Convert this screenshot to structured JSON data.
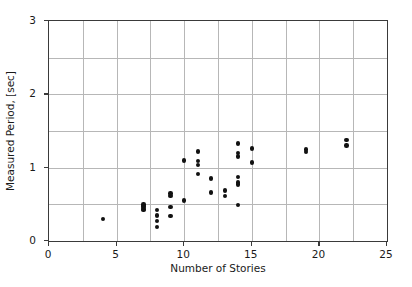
{
  "chart_data": {
    "type": "scatter",
    "title": "",
    "xlabel": "Number of Stories",
    "ylabel": "Measured Period, [sec]",
    "xlim": [
      0,
      25
    ],
    "ylim": [
      0,
      3
    ],
    "xticks": [
      0,
      5,
      10,
      15,
      20,
      25
    ],
    "yticks": [
      0,
      1,
      2,
      3
    ],
    "xticklabels": [
      "0",
      "5",
      "10",
      "15",
      "20",
      "25"
    ],
    "yticklabels": [
      "0",
      "1",
      "2",
      "3"
    ],
    "x_minor_gridlines": [
      2.5,
      5,
      7.5,
      10,
      12.5,
      15,
      17.5,
      20,
      22.5
    ],
    "y_minor_gridlines": [
      0.5,
      1.0,
      1.5,
      2.0,
      2.5
    ],
    "grid": true,
    "legend": null,
    "marker": "circle",
    "marker_color": "#111111",
    "points": [
      {
        "x": 4,
        "y": 0.3
      },
      {
        "x": 7,
        "y": 0.5
      },
      {
        "x": 7,
        "y": 0.48
      },
      {
        "x": 7,
        "y": 0.46
      },
      {
        "x": 7,
        "y": 0.44
      },
      {
        "x": 7,
        "y": 0.42
      },
      {
        "x": 8,
        "y": 0.42
      },
      {
        "x": 8,
        "y": 0.35
      },
      {
        "x": 8,
        "y": 0.27
      },
      {
        "x": 8,
        "y": 0.19
      },
      {
        "x": 9,
        "y": 0.65
      },
      {
        "x": 9,
        "y": 0.61
      },
      {
        "x": 9,
        "y": 0.46
      },
      {
        "x": 9,
        "y": 0.34
      },
      {
        "x": 10,
        "y": 1.1
      },
      {
        "x": 10,
        "y": 0.55
      },
      {
        "x": 11,
        "y": 1.22
      },
      {
        "x": 11,
        "y": 1.09
      },
      {
        "x": 11,
        "y": 1.04
      },
      {
        "x": 11,
        "y": 0.91
      },
      {
        "x": 12,
        "y": 0.85
      },
      {
        "x": 12,
        "y": 0.66
      },
      {
        "x": 13,
        "y": 0.69
      },
      {
        "x": 13,
        "y": 0.61
      },
      {
        "x": 14,
        "y": 1.33
      },
      {
        "x": 14,
        "y": 1.2
      },
      {
        "x": 14,
        "y": 1.15
      },
      {
        "x": 14,
        "y": 0.87
      },
      {
        "x": 14,
        "y": 0.8
      },
      {
        "x": 14,
        "y": 0.77
      },
      {
        "x": 14,
        "y": 0.49
      },
      {
        "x": 15,
        "y": 1.26
      },
      {
        "x": 15,
        "y": 1.07
      },
      {
        "x": 19,
        "y": 1.25
      },
      {
        "x": 19,
        "y": 1.21
      },
      {
        "x": 22,
        "y": 1.38
      },
      {
        "x": 22,
        "y": 1.3
      }
    ]
  },
  "axes": {
    "y_label_text": "Measured Period, [sec]",
    "x_label_text": "Number of Stories"
  }
}
